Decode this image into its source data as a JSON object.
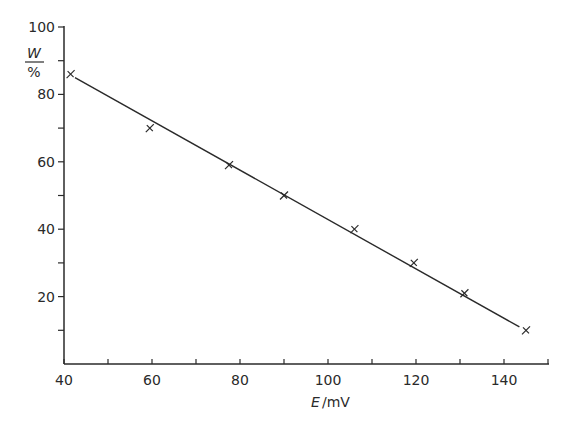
{
  "chart_data": {
    "type": "scatter",
    "title": "",
    "xlabel": "E / mV",
    "xlabel_symbol": "E",
    "xlabel_unit": "mV",
    "ylabel": "W / %",
    "ylabel_symbol": "W",
    "ylabel_unit": "%",
    "xlim": [
      40,
      150
    ],
    "ylim": [
      0,
      100
    ],
    "x_ticks": [
      40,
      60,
      80,
      100,
      120,
      140
    ],
    "x_minor_ticks": [
      50,
      70,
      90,
      110,
      130,
      150
    ],
    "y_ticks": [
      20,
      40,
      60,
      80,
      100
    ],
    "y_minor_ticks": [
      10,
      30,
      50,
      70,
      90
    ],
    "grid": false,
    "legend": null,
    "series": [
      {
        "name": "measured",
        "marker": "x",
        "points": [
          {
            "x": 41.5,
            "y": 86
          },
          {
            "x": 59.5,
            "y": 70
          },
          {
            "x": 77.5,
            "y": 59
          },
          {
            "x": 90,
            "y": 50
          },
          {
            "x": 106,
            "y": 40
          },
          {
            "x": 119.5,
            "y": 30
          },
          {
            "x": 131,
            "y": 21
          },
          {
            "x": 145,
            "y": 10
          }
        ]
      },
      {
        "name": "fit",
        "style": "line",
        "points": [
          {
            "x": 42.5,
            "y": 85
          },
          {
            "x": 143.5,
            "y": 11
          }
        ]
      }
    ]
  },
  "axes": {
    "x_title_symbol": "E",
    "x_title_unit": "/mV",
    "y_title_symbol": "W",
    "y_title_unit": "%"
  }
}
